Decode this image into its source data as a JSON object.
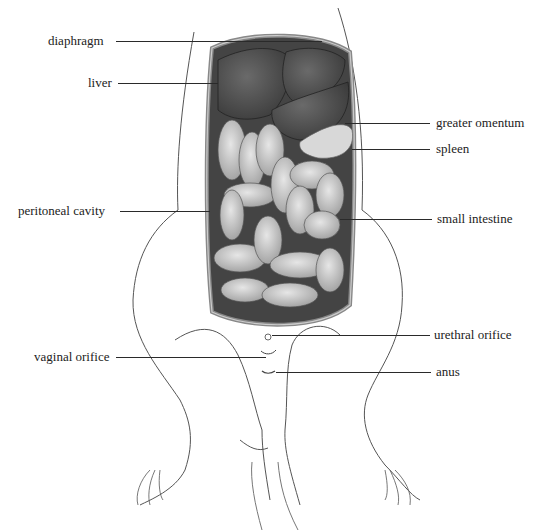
{
  "figure": {
    "labels": [
      {
        "id": "diaphragm",
        "text": "diaphragm",
        "side": "left"
      },
      {
        "id": "liver",
        "text": "liver",
        "side": "left"
      },
      {
        "id": "peritoneal_cavity",
        "text": "peritoneal cavity",
        "side": "left"
      },
      {
        "id": "vaginal_orifice",
        "text": "vaginal orifice",
        "side": "left"
      },
      {
        "id": "greater_omentum",
        "text": "greater omentum",
        "side": "right"
      },
      {
        "id": "spleen",
        "text": "spleen",
        "side": "right"
      },
      {
        "id": "small_intestine",
        "text": "small intestine",
        "side": "right"
      },
      {
        "id": "urethral_orifice",
        "text": "urethral orifice",
        "side": "right"
      },
      {
        "id": "anus",
        "text": "anus",
        "side": "right"
      }
    ]
  }
}
